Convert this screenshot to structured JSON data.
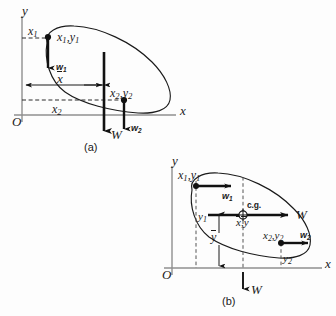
{
  "figure": {
    "background": "#fdfdfd",
    "ink": "#1a1a1a",
    "axis_color": "#8a8a8a"
  },
  "panel_a": {
    "caption": "(a)",
    "origin_label": "O",
    "y_axis_label": "y",
    "x_axis_label": "x",
    "labels": {
      "x1_tick": "x",
      "x1_tick_sub": "1",
      "point1": "x",
      "point1_sub1": "1",
      "point1_mid": ",y",
      "point1_sub2": "1",
      "w1": "w",
      "w1_sub": "1",
      "xbar": "x",
      "x2_tick": "x",
      "x2_tick_sub": "2",
      "point2": "x",
      "point2_sub1": "2",
      "point2_mid": ",y",
      "point2_sub2": "2",
      "W": "W",
      "w2": "w",
      "w2_sub": "2"
    }
  },
  "panel_b": {
    "caption": "(b)",
    "origin_label": "O",
    "y_axis_label": "y",
    "x_axis_label": "x",
    "labels": {
      "point1": "x",
      "point1_sub1": "1",
      "point1_mid": ",y",
      "point1_sub2": "1",
      "w1": "w",
      "w1_sub": "1",
      "cg": "c.g.",
      "centroid": "x",
      "centroid_mid": ",y",
      "W_right": "W",
      "y1": "y",
      "y1_sub": "1",
      "ybar": "y",
      "point2": "x",
      "point2_sub1": "2",
      "point2_mid": ",y",
      "point2_sub2": "2",
      "w2": "w",
      "w2_sub": "2",
      "y2": "y",
      "y2_sub": "2",
      "W_down": "W"
    }
  }
}
